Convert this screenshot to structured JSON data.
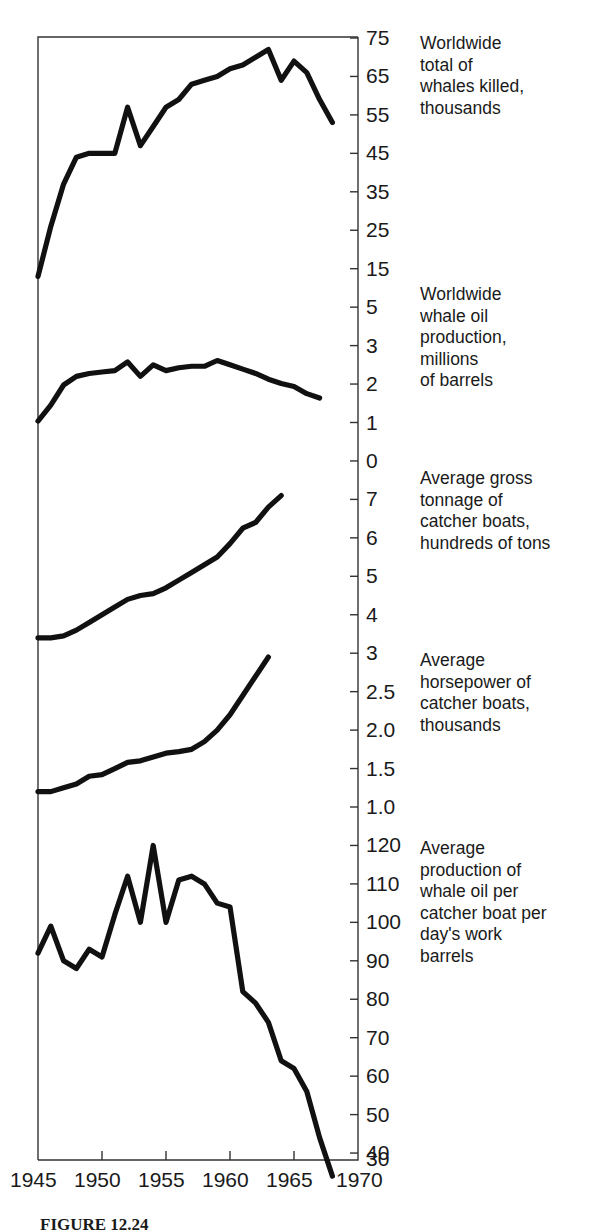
{
  "figure": {
    "caption": "FIGURE 12.24",
    "x_axis": {
      "label": "",
      "ticks": [
        "1945",
        "1950",
        "1955",
        "1960",
        "1965",
        "1970"
      ],
      "range": [
        1945,
        1970
      ]
    }
  },
  "panels": [
    {
      "id": "whales-killed",
      "caption": "Worldwide\ntotal of\nwhales killed,\nthousands",
      "yticks": [
        "75",
        "65",
        "55",
        "45",
        "35",
        "25",
        "15"
      ]
    },
    {
      "id": "whale-oil-production",
      "caption": "Worldwide\nwhale oil\nproduction,\nmillions\nof barrels",
      "yticks": [
        "5",
        "3",
        "2",
        "1"
      ]
    },
    {
      "id": "gross-tonnage",
      "caption": "Average gross\ntonnage of\ncatcher boats,\nhundreds of tons",
      "yticks": [
        "0",
        "7",
        "6",
        "5",
        "4"
      ]
    },
    {
      "id": "horsepower",
      "caption": "Average\nhorsepower of\ncatcher boats,\nthousands",
      "yticks": [
        "3",
        "2.5",
        "2.0",
        "1.5",
        "1.0"
      ]
    },
    {
      "id": "oil-per-boat-day",
      "caption": "Average\nproduction of\nwhale oil per\ncatcher boat per\nday's work\nbarrels",
      "yticks": [
        "120",
        "110",
        "100",
        "90",
        "80",
        "70",
        "60",
        "50",
        "40",
        "30"
      ]
    }
  ],
  "chart_data": {
    "type": "line",
    "title": "",
    "xlabel": "",
    "ylabel": "",
    "grid": false,
    "legend": "none",
    "x_range": [
      1945,
      1970
    ],
    "series": [
      {
        "name": "Worldwide total of whales killed, thousands",
        "ylabel": "thousands",
        "ylim": [
          10,
          77
        ],
        "yticks": [
          75,
          65,
          55,
          45,
          35,
          25,
          15
        ],
        "x": [
          1945,
          1946,
          1947,
          1948,
          1949,
          1950,
          1951,
          1952,
          1953,
          1954,
          1955,
          1956,
          1957,
          1958,
          1959,
          1960,
          1961,
          1962,
          1963,
          1964,
          1965,
          1966,
          1967,
          1968
        ],
        "values": [
          13,
          26,
          37,
          44,
          45,
          45,
          45,
          57,
          47,
          52,
          57,
          59,
          63,
          64,
          65,
          67,
          68,
          70,
          72,
          64,
          69,
          66,
          59,
          53
        ]
      },
      {
        "name": "Worldwide whale oil production, millions of barrels",
        "ylabel": "millions of barrels",
        "ylim": [
          0.6,
          5.0
        ],
        "yticks": [
          5,
          3,
          2,
          1
        ],
        "x": [
          1945,
          1946,
          1947,
          1948,
          1949,
          1950,
          1951,
          1952,
          1953,
          1954,
          1955,
          1956,
          1957,
          1958,
          1959,
          1960,
          1961,
          1962,
          1963,
          1964,
          1965,
          1966,
          1967
        ],
        "values": [
          1.05,
          1.6,
          2.3,
          2.6,
          2.7,
          2.75,
          2.8,
          3.1,
          2.6,
          3.0,
          2.8,
          2.9,
          2.95,
          2.95,
          3.15,
          3.0,
          2.85,
          2.7,
          2.5,
          2.35,
          2.25,
          2.0,
          1.85
        ]
      },
      {
        "name": "Average gross tonnage of catcher boats, hundreds of tons",
        "ylabel": "hundreds of tons",
        "ylim": [
          3.3,
          7.8
        ],
        "yticks": [
          7,
          6,
          5,
          4
        ],
        "x": [
          1945,
          1946,
          1947,
          1948,
          1949,
          1950,
          1951,
          1952,
          1953,
          1954,
          1955,
          1956,
          1957,
          1958,
          1959,
          1960,
          1961,
          1962,
          1963,
          1964
        ],
        "values": [
          3.4,
          3.4,
          3.45,
          3.6,
          3.8,
          4.0,
          4.2,
          4.4,
          4.5,
          4.55,
          4.7,
          4.9,
          5.1,
          5.3,
          5.5,
          5.85,
          6.25,
          6.4,
          6.8,
          7.1
        ]
      },
      {
        "name": "Average horsepower of catcher boats, thousands",
        "ylabel": "thousands",
        "ylim": [
          0.95,
          3.15
        ],
        "yticks": [
          3,
          2.5,
          2.0,
          1.5,
          1.0
        ],
        "x": [
          1945,
          1946,
          1947,
          1948,
          1949,
          1950,
          1951,
          1952,
          1953,
          1954,
          1955,
          1956,
          1957,
          1958,
          1959,
          1960,
          1961,
          1962,
          1963
        ],
        "values": [
          1.2,
          1.2,
          1.25,
          1.3,
          1.4,
          1.42,
          1.5,
          1.58,
          1.6,
          1.65,
          1.7,
          1.72,
          1.75,
          1.85,
          2.0,
          2.2,
          2.45,
          2.7,
          2.95
        ]
      },
      {
        "name": "Average production of whale oil per catcher boat per day's work, barrels",
        "ylabel": "barrels",
        "ylim": [
          30,
          126
        ],
        "yticks": [
          120,
          110,
          100,
          90,
          80,
          70,
          60,
          50,
          40,
          30
        ],
        "x": [
          1945,
          1946,
          1947,
          1948,
          1949,
          1950,
          1951,
          1952,
          1953,
          1954,
          1955,
          1956,
          1957,
          1958,
          1959,
          1960,
          1961,
          1962,
          1963,
          1964,
          1965,
          1966,
          1967,
          1968
        ],
        "values": [
          92,
          99,
          90,
          88,
          93,
          91,
          102,
          112,
          100,
          120,
          100,
          111,
          112,
          110,
          105,
          104,
          82,
          79,
          74,
          64,
          62,
          56,
          44,
          34
        ]
      }
    ]
  }
}
